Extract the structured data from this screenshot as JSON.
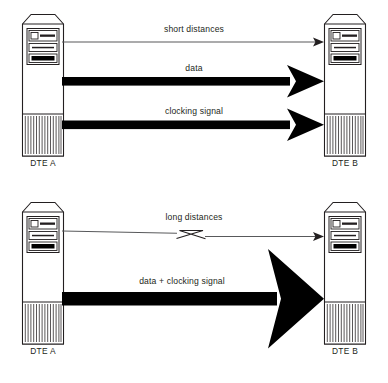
{
  "diagram": {
    "colors": {
      "stroke": "#231f20",
      "fill_black": "#000000",
      "background": "#ffffff",
      "thin_line": "#58595b",
      "text": "#231f20"
    },
    "panels": [
      {
        "id": "short-distance-panel",
        "nodes": [
          {
            "id": "dte-a-top",
            "label": "DTE A",
            "icon": "computer-tower-icon"
          },
          {
            "id": "dte-b-top",
            "label": "DTE B",
            "icon": "computer-tower-icon"
          }
        ],
        "connections": [
          {
            "id": "short-distances",
            "label": "short distances",
            "style": "thin-arrow",
            "direction": "a-to-b",
            "broken": false
          },
          {
            "id": "data",
            "label": "data",
            "style": "thick-arrow",
            "direction": "a-to-b",
            "broken": false
          },
          {
            "id": "clocking-signal",
            "label": "clocking signal",
            "style": "thick-arrow",
            "direction": "a-to-b",
            "broken": false
          }
        ]
      },
      {
        "id": "long-distance-panel",
        "nodes": [
          {
            "id": "dte-a-bottom",
            "label": "DTE A",
            "icon": "computer-tower-icon"
          },
          {
            "id": "dte-b-bottom",
            "label": "DTE B",
            "icon": "computer-tower-icon"
          }
        ],
        "connections": [
          {
            "id": "long-distances",
            "label": "long distances",
            "style": "thin-arrow",
            "direction": "a-to-b",
            "broken": true
          },
          {
            "id": "data-plus-clocking-signal",
            "label": "data + clocking signal",
            "style": "thick-arrow-large",
            "direction": "a-to-b",
            "broken": false
          }
        ]
      }
    ],
    "labels": {
      "short_distances": "short distances",
      "data": "data",
      "clocking_signal": "clocking signal",
      "long_distances": "long distances",
      "data_plus_clocking_signal": "data + clocking signal",
      "dte_a_top": "DTE A",
      "dte_b_top": "DTE B",
      "dte_a_bottom": "DTE A",
      "dte_b_bottom": "DTE B"
    }
  }
}
